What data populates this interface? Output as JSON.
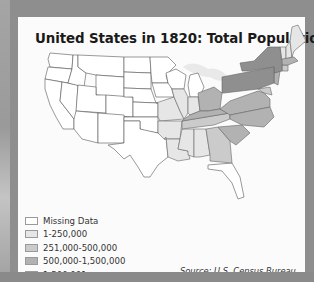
{
  "map": {
    "title": "United States in 1820: Total Population",
    "source": "Source: U.S. Census Bureau",
    "colors": {
      "missing": "#ffffff",
      "tier1": "#e6e6e6",
      "tier2": "#cbcbcb",
      "tier3": "#b2b2b2",
      "tier4": "#8f8f8f",
      "border": "#555555",
      "frame": "#8e8e8e",
      "panel": "#fbfbfb"
    },
    "legend": [
      {
        "label": "Missing Data",
        "color": "#ffffff"
      },
      {
        "label": "1-250,000",
        "color": "#e6e6e6"
      },
      {
        "label": "251,000-500,000",
        "color": "#cbcbcb"
      },
      {
        "label": "500,000-1,500,000",
        "color": "#b2b2b2"
      },
      {
        "label": "1,500,001 or more",
        "color": "#8f8f8f"
      }
    ],
    "regions": {
      "missing_data": [
        "Western territories (WA, OR, CA, NV, ID, MT, WY, UT, CO, AZ, NM, ND, SD, NE, KS, OK, TX, MN, IA, WI, MI, Florida)"
      ],
      "tier_1_250000": [
        "Illinois",
        "Indiana",
        "Missouri",
        "Arkansas",
        "Louisiana",
        "Mississippi",
        "Alabama",
        "Vermont",
        "New Hampshire",
        "Maine",
        "Rhode Island",
        "Delaware"
      ],
      "tier_251000_500000": [
        "Georgia",
        "Tennessee",
        "Connecticut",
        "Maryland"
      ],
      "tier_500000_1500000": [
        "Ohio",
        "Kentucky",
        "North Carolina",
        "South Carolina",
        "Massachusetts",
        "New Jersey",
        "Virginia"
      ],
      "tier_1500001_plus": [
        "New York",
        "Pennsylvania"
      ]
    }
  }
}
